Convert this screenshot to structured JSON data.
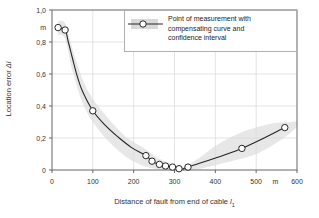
{
  "chart_data": {
    "type": "line",
    "title": "",
    "xlabel_prefix": "Distance of fault from end of cable ",
    "xlabel_var": "l",
    "xlabel_sub": "1",
    "ylabel_prefix": "Location error ",
    "ylabel_var": "Δl",
    "xlim": [
      0,
      600
    ],
    "ylim": [
      0,
      1.0
    ],
    "x_unit": "m",
    "y_unit": "m",
    "grid": true,
    "x_ticks": [
      {
        "v": 0,
        "label": "0"
      },
      {
        "v": 100,
        "label": "100"
      },
      {
        "v": 200,
        "label": "200"
      },
      {
        "v": 300,
        "label": "300"
      },
      {
        "v": 400,
        "label": "400"
      },
      {
        "v": 500,
        "label": "500"
      },
      {
        "v": 600,
        "label": "600"
      }
    ],
    "x_unit_pos": 547,
    "y_ticks": [
      {
        "v": 0,
        "label": "0"
      },
      {
        "v": 0.2,
        "label": "0,2"
      },
      {
        "v": 0.4,
        "label": "0,4"
      },
      {
        "v": 0.6,
        "label": "0,6"
      },
      {
        "v": 0.8,
        "label": "0,8"
      },
      {
        "v": 1.0,
        "label": "1,0"
      }
    ],
    "legend": {
      "position": "top-right",
      "lines": [
        "Point of measurement with",
        "compensating curve and",
        "confidence interval"
      ]
    },
    "points": [
      [
        15,
        0.89
      ],
      [
        32,
        0.875
      ],
      [
        100,
        0.37
      ],
      [
        230,
        0.09
      ],
      [
        245,
        0.055
      ],
      [
        263,
        0.035
      ],
      [
        278,
        0.025
      ],
      [
        295,
        0.018
      ],
      [
        311,
        0.008
      ],
      [
        333,
        0.018
      ],
      [
        465,
        0.135
      ],
      [
        570,
        0.265
      ]
    ],
    "curve": [
      [
        15,
        0.89
      ],
      [
        32,
        0.875
      ],
      [
        40,
        0.8
      ],
      [
        50,
        0.7
      ],
      [
        62,
        0.585
      ],
      [
        75,
        0.49
      ],
      [
        100,
        0.37
      ],
      [
        130,
        0.28
      ],
      [
        160,
        0.21
      ],
      [
        195,
        0.14
      ],
      [
        230,
        0.09
      ],
      [
        245,
        0.055
      ],
      [
        263,
        0.035
      ],
      [
        278,
        0.025
      ],
      [
        295,
        0.018
      ],
      [
        311,
        0.008
      ],
      [
        322,
        0.006
      ],
      [
        333,
        0.018
      ],
      [
        465,
        0.135
      ],
      [
        570,
        0.265
      ]
    ],
    "band": [
      {
        "x": 15,
        "lo": 0.845,
        "hi": 0.93
      },
      {
        "x": 32,
        "lo": 0.82,
        "hi": 0.915
      },
      {
        "x": 50,
        "lo": 0.62,
        "hi": 0.76
      },
      {
        "x": 75,
        "lo": 0.42,
        "hi": 0.565
      },
      {
        "x": 100,
        "lo": 0.3,
        "hi": 0.445
      },
      {
        "x": 140,
        "lo": 0.175,
        "hi": 0.315
      },
      {
        "x": 180,
        "lo": 0.085,
        "hi": 0.21
      },
      {
        "x": 220,
        "lo": 0.03,
        "hi": 0.145
      },
      {
        "x": 260,
        "lo": 0.005,
        "hi": 0.075
      },
      {
        "x": 300,
        "lo": 0.0,
        "hi": 0.03
      },
      {
        "x": 325,
        "lo": 0.0,
        "hi": 0.022
      },
      {
        "x": 355,
        "lo": 0.005,
        "hi": 0.065
      },
      {
        "x": 400,
        "lo": 0.03,
        "hi": 0.15
      },
      {
        "x": 455,
        "lo": 0.065,
        "hi": 0.225
      },
      {
        "x": 505,
        "lo": 0.105,
        "hi": 0.27
      },
      {
        "x": 550,
        "lo": 0.17,
        "hi": 0.295
      },
      {
        "x": 585,
        "lo": 0.235,
        "hi": 0.3
      },
      {
        "x": 600,
        "lo": 0.27,
        "hi": 0.305
      }
    ],
    "colors": {
      "line": "#262626",
      "marker_fill": "#ffffff",
      "band": "#d9d9d9",
      "grid": "#dcdcdc",
      "frame": "#666666",
      "text": "#333333"
    }
  }
}
